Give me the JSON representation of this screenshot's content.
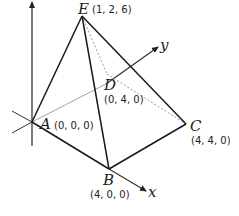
{
  "diagram": {
    "type": "pyramid-3d-coordinates",
    "axes": {
      "x_label": "x",
      "y_label": "y"
    },
    "points": {
      "A": {
        "label": "A",
        "coord": "(0, 0, 0)"
      },
      "B": {
        "label": "B",
        "coord": "(4, 0, 0)"
      },
      "C": {
        "label": "C",
        "coord": "(4, 4, 0)"
      },
      "D": {
        "label": "D",
        "coord": "(0, 4, 0)"
      },
      "E": {
        "label": "E",
        "coord": "(1, 2, 6)"
      }
    },
    "colors": {
      "solid_edge": "#1a1a1a",
      "hidden_edge": "#9a9a9a",
      "axis": "#333333"
    }
  }
}
